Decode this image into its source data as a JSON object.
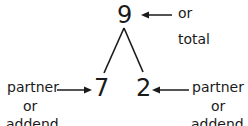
{
  "diagram": {
    "whole": {
      "value": "9",
      "label_line1": "or",
      "label_line2": "total"
    },
    "parts": [
      {
        "value": "7",
        "label_line1": "partner",
        "label_line2": "or",
        "label_line3": "addend"
      },
      {
        "value": "2",
        "label_line1": "partner",
        "label_line2": "or",
        "label_line3": "addend"
      }
    ],
    "colors": {
      "ink": "#1a1a1a",
      "background": "#ffffff"
    }
  }
}
